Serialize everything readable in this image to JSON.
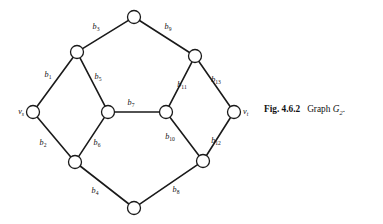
{
  "figure": {
    "caption_number": "Fig. 4.6.2",
    "caption_text": "Graph",
    "caption_graph_name": "G",
    "caption_graph_subscript": "2",
    "caption_period": "."
  },
  "diagram": {
    "type": "undirected-graph",
    "background_color": "#ffffff",
    "edge_color": "#1a1a1a",
    "vertex_fill": "#ffffff",
    "vertex_stroke": "#1a1a1a",
    "vertex_radius": 6.5,
    "vertices": [
      {
        "id": "top",
        "label": "",
        "sub": "",
        "x": 134,
        "y": 17
      },
      {
        "id": "upper-left",
        "label": "",
        "sub": "",
        "x": 77,
        "y": 52
      },
      {
        "id": "upper-right",
        "label": "",
        "sub": "",
        "x": 195,
        "y": 56
      },
      {
        "id": "source",
        "label": "v",
        "sub": "s",
        "x": 33,
        "y": 112
      },
      {
        "id": "center-left",
        "label": "",
        "sub": "",
        "x": 108,
        "y": 112
      },
      {
        "id": "center-right",
        "label": "",
        "sub": "",
        "x": 166,
        "y": 112
      },
      {
        "id": "sink",
        "label": "v",
        "sub": "t",
        "x": 234,
        "y": 112
      },
      {
        "id": "lower-left",
        "label": "",
        "sub": "",
        "x": 75,
        "y": 162
      },
      {
        "id": "lower-right",
        "label": "",
        "sub": "",
        "x": 203,
        "y": 161
      },
      {
        "id": "bottom",
        "label": "",
        "sub": "",
        "x": 134,
        "y": 208
      }
    ],
    "edges": [
      {
        "id": "b1",
        "label": "b",
        "sub": "1",
        "from": "source",
        "to": "upper-left",
        "label_x": 48,
        "label_y": 77
      },
      {
        "id": "b2",
        "label": "b",
        "sub": "2",
        "from": "source",
        "to": "lower-left",
        "label_x": 43,
        "label_y": 145
      },
      {
        "id": "b3",
        "label": "b",
        "sub": "3",
        "from": "upper-left",
        "to": "top",
        "label_x": 96,
        "label_y": 29
      },
      {
        "id": "b4",
        "label": "b",
        "sub": "4",
        "from": "lower-left",
        "to": "bottom",
        "label_x": 95,
        "label_y": 193
      },
      {
        "id": "b5",
        "label": "b",
        "sub": "5",
        "from": "upper-left",
        "to": "center-left",
        "label_x": 98,
        "label_y": 79
      },
      {
        "id": "b6",
        "label": "b",
        "sub": "6",
        "from": "center-left",
        "to": "lower-left",
        "label_x": 97,
        "label_y": 145
      },
      {
        "id": "b7",
        "label": "b",
        "sub": "7",
        "from": "center-left",
        "to": "center-right",
        "label_x": 131,
        "label_y": 105
      },
      {
        "id": "b8",
        "label": "b",
        "sub": "8",
        "from": "bottom",
        "to": "lower-right",
        "label_x": 176,
        "label_y": 192
      },
      {
        "id": "b9",
        "label": "b",
        "sub": "9",
        "from": "top",
        "to": "upper-right",
        "label_x": 168,
        "label_y": 29
      },
      {
        "id": "b10",
        "label": "b",
        "sub": "10",
        "from": "center-right",
        "to": "lower-right",
        "label_x": 170,
        "label_y": 139
      },
      {
        "id": "b11",
        "label": "b",
        "sub": "11",
        "from": "center-right",
        "to": "upper-right",
        "label_x": 182,
        "label_y": 87
      },
      {
        "id": "b12",
        "label": "b",
        "sub": "12",
        "from": "lower-right",
        "to": "sink",
        "label_x": 216,
        "label_y": 143
      },
      {
        "id": "b13",
        "label": "b",
        "sub": "13",
        "from": "upper-right",
        "to": "sink",
        "label_x": 216,
        "label_y": 82
      }
    ]
  }
}
